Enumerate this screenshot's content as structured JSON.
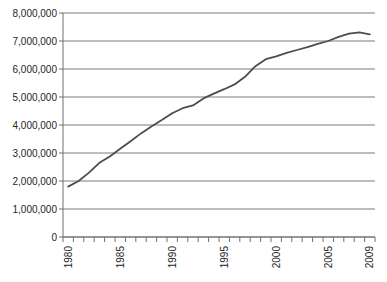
{
  "window": {
    "title": "line chart scan"
  },
  "colors": {
    "background": "#ffffff",
    "grid": "#7d7d7d",
    "axis": "#6f6f6f",
    "tick": "#6f6f6f",
    "series_line": "#4d4d4d",
    "label_text": "#262626"
  },
  "y_axis": {
    "labels": [
      "8,000,000",
      "7,000,000",
      "6,000,000",
      "5,000,000",
      "4,000,000",
      "3,000,000",
      "2,000,000",
      "1,000,000",
      "0"
    ],
    "values": [
      8000000,
      7000000,
      6000000,
      5000000,
      4000000,
      3000000,
      2000000,
      1000000,
      0
    ]
  },
  "x_axis": {
    "labeled_ticks": [
      {
        "label": "1980",
        "year": 1980
      },
      {
        "label": "1985",
        "year": 1985
      },
      {
        "label": "1990",
        "year": 1990
      },
      {
        "label": "1995",
        "year": 1995
      },
      {
        "label": "2000",
        "year": 2000
      },
      {
        "label": "2005",
        "year": 2005
      },
      {
        "label": "2009",
        "year": 2009
      }
    ],
    "first_year": 1980,
    "last_year": 2009
  },
  "chart_data": {
    "type": "line",
    "title": "",
    "xlabel": "",
    "ylabel": "",
    "legend": "none",
    "grid": "horizontal",
    "ylim": [
      0,
      8000000
    ],
    "x": [
      1980,
      1981,
      1982,
      1983,
      1984,
      1985,
      1986,
      1987,
      1988,
      1989,
      1990,
      1991,
      1992,
      1993,
      1994,
      1995,
      1996,
      1997,
      1998,
      1999,
      2000,
      2001,
      2002,
      2003,
      2004,
      2005,
      2006,
      2007,
      2008,
      2009
    ],
    "values": [
      1800000,
      2000000,
      2300000,
      2650000,
      2880000,
      3150000,
      3420000,
      3700000,
      3950000,
      4180000,
      4420000,
      4600000,
      4700000,
      4950000,
      5120000,
      5280000,
      5450000,
      5720000,
      6100000,
      6350000,
      6450000,
      6580000,
      6680000,
      6780000,
      6900000,
      7000000,
      7150000,
      7260000,
      7310000,
      7240000
    ]
  }
}
